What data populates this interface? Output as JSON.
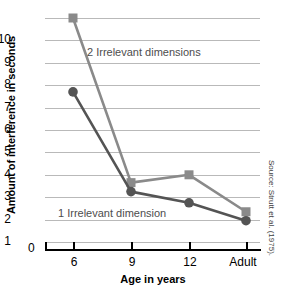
{
  "chart_data": {
    "type": "line",
    "title": "",
    "xlabel": "Age in years",
    "ylabel": "Amount of interference in seconds",
    "categories": [
      "6",
      "9",
      "12",
      "Adult"
    ],
    "ylim": [
      0,
      10
    ],
    "yticks": [
      "0",
      "1",
      "2",
      "3",
      "4",
      "5",
      "6",
      "7",
      "8",
      "9",
      "10"
    ],
    "grid": true,
    "legend_position": "inline-annotations",
    "series": [
      {
        "name": "2 Irrelevant dimensions",
        "marker": "square",
        "color": "#8a8a8a",
        "values": [
          10.0,
          2.65,
          3.0,
          1.35
        ]
      },
      {
        "name": "1 Irrelevant dimension",
        "marker": "circle",
        "color": "#545454",
        "values": [
          6.7,
          2.25,
          1.75,
          0.95
        ]
      }
    ],
    "annotations": [
      "2 Irrelevant dimensions",
      "1 Irrelevant dimension"
    ]
  },
  "source_note": "Source: Strutt et al. (1975)."
}
